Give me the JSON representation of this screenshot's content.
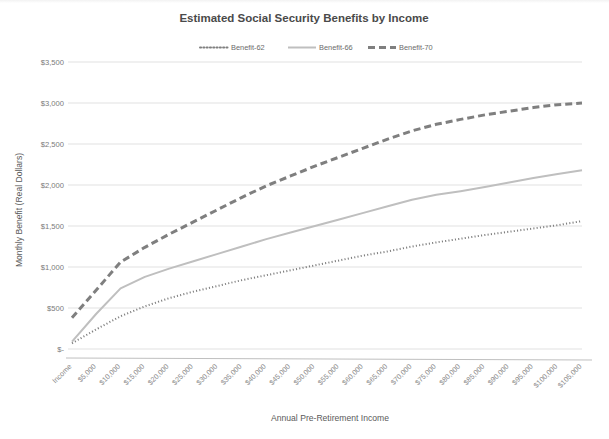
{
  "chart_data": {
    "type": "line",
    "title": "Estimated Social Security Benefits by Income",
    "xlabel": "Annual Pre-Retirement Income",
    "ylabel": "Monthly Benefit (Real Dollars)",
    "grid": true,
    "legend_position": "top",
    "ylim": [
      0,
      3500
    ],
    "y_ticks": [
      0,
      500,
      1000,
      1500,
      2000,
      2500,
      3000,
      3500
    ],
    "y_tick_labels": [
      "$-",
      "$500",
      "$1,000",
      "$1,500",
      "$2,000",
      "$2,500",
      "$3,000",
      "$3,500"
    ],
    "categories": [
      "Income",
      "$5,000",
      "$10,000",
      "$15,000",
      "$20,000",
      "$25,000",
      "$30,000",
      "$35,000",
      "$40,000",
      "$45,000",
      "$50,000",
      "$55,000",
      "$60,000",
      "$65,000",
      "$70,000",
      "$75,000",
      "$80,000",
      "$85,000",
      "$90,000",
      "$95,000",
      "$100,000",
      "$105,000"
    ],
    "series": [
      {
        "name": "Benefit-62",
        "style": "dotted",
        "color": "#808080",
        "values": [
          70,
          240,
          400,
          520,
          620,
          700,
          770,
          840,
          900,
          960,
          1020,
          1080,
          1140,
          1190,
          1250,
          1300,
          1345,
          1390,
          1430,
          1470,
          1510,
          1560
        ]
      },
      {
        "name": "Benefit-66",
        "style": "solid",
        "color": "#bfbfbf",
        "values": [
          90,
          430,
          740,
          880,
          980,
          1070,
          1160,
          1250,
          1340,
          1420,
          1500,
          1580,
          1660,
          1740,
          1820,
          1880,
          1925,
          1975,
          2030,
          2085,
          2135,
          2180
        ]
      },
      {
        "name": "Benefit-70",
        "style": "dashed",
        "color": "#7f7f7f",
        "values": [
          380,
          720,
          1060,
          1240,
          1400,
          1550,
          1700,
          1850,
          1990,
          2110,
          2230,
          2340,
          2450,
          2560,
          2660,
          2740,
          2800,
          2855,
          2900,
          2945,
          2980,
          3000
        ]
      }
    ]
  },
  "legend": {
    "items": [
      {
        "label": "Benefit-62"
      },
      {
        "label": "Benefit-66"
      },
      {
        "label": "Benefit-70"
      }
    ]
  }
}
